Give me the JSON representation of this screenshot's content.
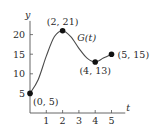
{
  "chart_data": {
    "type": "line",
    "title": "",
    "xlabel": "t",
    "ylabel": "y",
    "curve_label": "G(t)",
    "xlim": [
      0,
      5.6
    ],
    "ylim": [
      0,
      24
    ],
    "x_ticks": [
      1,
      2,
      3,
      4,
      5
    ],
    "x_tick_labels": [
      "1",
      "2",
      "3",
      "4",
      "5"
    ],
    "y_ticks": [
      5,
      10,
      15,
      20
    ],
    "y_tick_labels": [
      "5",
      "10",
      "15",
      "20"
    ],
    "grid": false,
    "legend": "none",
    "series": [
      {
        "name": "G(t)",
        "x": [
          0,
          0.5,
          1,
          1.5,
          2,
          2.5,
          3,
          3.5,
          4,
          4.5,
          5
        ],
        "y": [
          5,
          8.5,
          14.5,
          19.5,
          21,
          19.5,
          16.5,
          14,
          13,
          14,
          15
        ]
      }
    ],
    "points": [
      {
        "x": 0,
        "y": 5,
        "label": "(0, 5)",
        "anchor": "below-right"
      },
      {
        "x": 2,
        "y": 21,
        "label": "(2, 21)",
        "anchor": "above"
      },
      {
        "x": 4,
        "y": 13,
        "label": "(4, 13)",
        "anchor": "below"
      },
      {
        "x": 5,
        "y": 15,
        "label": "(5, 15)",
        "anchor": "right"
      }
    ]
  }
}
